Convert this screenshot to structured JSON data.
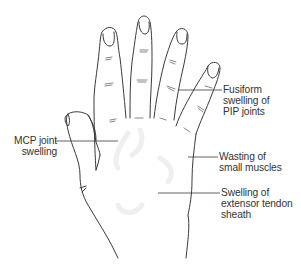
{
  "figure": {
    "colors": {
      "outline": "#3a3a3a",
      "leader": "#3a3a3a",
      "text": "#333333",
      "background": "#ffffff",
      "shading": "#eeeeee"
    }
  },
  "annotations": [
    {
      "id": "pip",
      "lines": [
        "Fusiform",
        "swelling of",
        "PIP joints"
      ]
    },
    {
      "id": "mcp",
      "lines": [
        "MCP joint",
        "swelling"
      ]
    },
    {
      "id": "wasting",
      "lines": [
        "Wasting of",
        "small muscles"
      ]
    },
    {
      "id": "tendon",
      "lines": [
        "Swelling of",
        "extensor tendon",
        "sheath"
      ]
    }
  ]
}
